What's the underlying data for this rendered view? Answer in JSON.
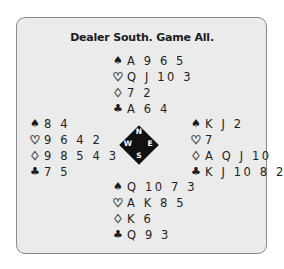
{
  "title": "Dealer South. Game All.",
  "suit_symbols": {
    "spades": "♠",
    "hearts": "♡",
    "diamonds": "♢",
    "clubs": "♣"
  },
  "hands": {
    "north": {
      "spades": "A 9 6 5",
      "hearts": "Q J 10 3",
      "diamonds": "7 2",
      "clubs": "A 6 4"
    },
    "west": {
      "spades": "8 4",
      "hearts": "9 6 4 2",
      "diamonds": "9 8 5 4 3",
      "clubs": "7 5"
    },
    "east": {
      "spades": "K J 2",
      "hearts": "7",
      "diamonds": "A Q J 10",
      "clubs": "K J 10 8 2"
    },
    "south": {
      "spades": "Q 10 7 3",
      "hearts": "A K 8 5",
      "diamonds": "K 6",
      "clubs": "Q 9 3"
    }
  },
  "compass": {
    "north": "N",
    "west": "W",
    "east": "E",
    "south": "S"
  },
  "colors": {
    "panel_bg": "#ebebeb",
    "panel_border": "#8a8a8a",
    "compass_bg": "#111111"
  }
}
